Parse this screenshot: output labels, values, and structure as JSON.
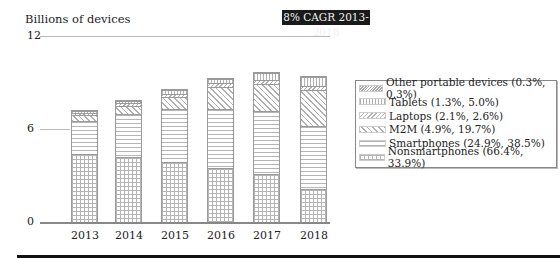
{
  "header": {
    "ylabel": "Billions of devices",
    "badge": "8% CAGR 2013-2018"
  },
  "axis": {
    "ticks": [
      "12",
      "6",
      "0"
    ]
  },
  "legend": [
    {
      "key": "other",
      "label": "Other portable devices (0.3%, 0.3%)"
    },
    {
      "key": "tablet",
      "label": "Tablets (1.3%, 5.0%)"
    },
    {
      "key": "laptop",
      "label": "Laptops (2.1%, 2.6%)"
    },
    {
      "key": "m2m",
      "label": "M2M (4.9%, 19.7%)"
    },
    {
      "key": "smart",
      "label": "Smartphones (24.9%, 38.5%)"
    },
    {
      "key": "nonsmart",
      "label": "Nonsmartphones (66.4%, 33.9%)"
    }
  ],
  "chart_data": {
    "type": "bar",
    "stacked": true,
    "title": "8% CAGR 2013-2018",
    "xlabel": "",
    "ylabel": "Billions of devices",
    "ylim": [
      0,
      12
    ],
    "yticks": [
      0,
      6,
      12
    ],
    "grid": true,
    "legend_position": "right",
    "categories": [
      "2013",
      "2014",
      "2015",
      "2016",
      "2017",
      "2018"
    ],
    "series": [
      {
        "name": "Nonsmartphones (66.4%, 33.9%)",
        "values": [
          4.4,
          4.2,
          3.9,
          3.5,
          3.1,
          2.1
        ]
      },
      {
        "name": "Smartphones (24.9%, 38.5%)",
        "values": [
          2.1,
          2.8,
          3.4,
          3.8,
          4.1,
          4.1
        ]
      },
      {
        "name": "M2M (4.9%, 19.7%)",
        "values": [
          0.4,
          0.5,
          0.8,
          1.4,
          1.7,
          2.3
        ]
      },
      {
        "name": "Laptops (2.1%, 2.6%)",
        "values": [
          0.15,
          0.2,
          0.2,
          0.25,
          0.25,
          0.3
        ]
      },
      {
        "name": "Tablets (1.3%, 5.0%)",
        "values": [
          0.1,
          0.15,
          0.25,
          0.3,
          0.45,
          0.55
        ]
      },
      {
        "name": "Other portable devices (0.3%, 0.3%)",
        "values": [
          0.1,
          0.05,
          0.05,
          0.05,
          0.05,
          0.05
        ]
      }
    ]
  }
}
